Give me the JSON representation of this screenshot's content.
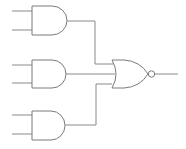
{
  "diagram": {
    "type": "logic-circuit",
    "colors": {
      "line": "#7a7a7a",
      "background": "#ffffff"
    },
    "gates": [
      {
        "id": "and1",
        "type": "AND",
        "inputs": 2
      },
      {
        "id": "and2",
        "type": "AND",
        "inputs": 2
      },
      {
        "id": "and3",
        "type": "AND",
        "inputs": 2
      },
      {
        "id": "nor1",
        "type": "NOR",
        "inputs": 3
      }
    ],
    "connections": [
      {
        "from": "and1.out",
        "to": "nor1.in1"
      },
      {
        "from": "and2.out",
        "to": "nor1.in2"
      },
      {
        "from": "and3.out",
        "to": "nor1.in3"
      }
    ]
  }
}
